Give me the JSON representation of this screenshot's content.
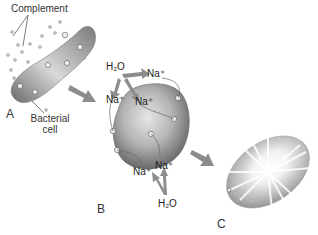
{
  "diagram": {
    "labels": {
      "complement": "Complement",
      "bacterial_cell_line1": "Bacterial",
      "bacterial_cell_line2": "cell",
      "panel_a": "A",
      "panel_b": "B",
      "panel_c": "C"
    },
    "panel_b_top": {
      "water": "H₂O",
      "ion_1": "Na⁺",
      "ion_2": "Na⁺",
      "ion_3": "Na⁺"
    },
    "panel_b_bottom": {
      "water": "H₂O",
      "ion_1": "Na⁺",
      "ion_2": "Na⁺"
    },
    "colors": {
      "cell_dark": "#5a5a5a",
      "cell_light": "#d8d8d8",
      "arrow": "#8c8c8c",
      "text": "#222222"
    }
  }
}
